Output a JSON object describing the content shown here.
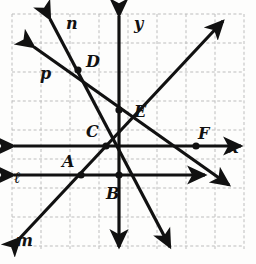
{
  "figure": {
    "background": "#fdfdfc",
    "grid": {
      "color": "#bdbdbd",
      "style": "dashed",
      "origin_px": [
        119,
        146
      ],
      "spacing_px": 29,
      "left_px": 12,
      "top_px": 14,
      "right_px": 244,
      "bottom_px": 249,
      "columns": 8,
      "rows": 8
    },
    "stroke_color": "#111111",
    "line_width_px": 3.2,
    "axes": [
      {
        "name": "x-axis",
        "label": "x",
        "label_px": [
          229,
          140
        ],
        "from_px": [
          14,
          146
        ],
        "to_px": [
          241,
          146
        ],
        "arrows": "both"
      },
      {
        "name": "y-axis",
        "label": "y",
        "label_px": [
          134,
          16
        ],
        "from_px": [
          119,
          16
        ],
        "to_px": [
          119,
          247
        ],
        "arrows": "both"
      }
    ],
    "lines": [
      {
        "name": "line-l",
        "label": "ℓ",
        "label_px": [
          14,
          170
        ],
        "from_px": [
          14,
          175
        ],
        "to_px": [
          205,
          175
        ],
        "arrows": "both",
        "description": "horizontal line below the x-axis"
      },
      {
        "name": "line-m",
        "label": "m",
        "label_px": [
          16,
          233
        ],
        "from_px": [
          20,
          238
        ],
        "to_px": [
          223,
          21
        ],
        "arrows": "both",
        "description": "diagonal rising to upper right through E"
      },
      {
        "name": "line-n",
        "label": "n",
        "label_px": [
          66,
          16
        ],
        "from_px": [
          50,
          19
        ],
        "to_px": [
          170,
          247
        ],
        "arrows": "both",
        "description": "steep line falling to lower right through D, C, B"
      },
      {
        "name": "line-p",
        "label": "p",
        "label_px": [
          40,
          66
        ],
        "from_px": [
          34,
          47
        ],
        "to_px": [
          229,
          185
        ],
        "arrows": "both",
        "description": "line falling to lower right through D, E, F"
      }
    ],
    "points": [
      {
        "name": "point-A",
        "label": "A",
        "at_px": [
          81,
          175
        ],
        "label_px": [
          62,
          154
        ],
        "lines": [
          "line-l",
          "line-m"
        ]
      },
      {
        "name": "point-B",
        "label": "B",
        "at_px": [
          119,
          175
        ],
        "label_px": [
          106,
          186
        ],
        "lines": [
          "line-l",
          "line-n",
          "y-axis"
        ]
      },
      {
        "name": "point-C",
        "label": "C",
        "at_px": [
          106,
          146
        ],
        "label_px": [
          86,
          124
        ],
        "lines": [
          "x-axis",
          "line-m",
          "line-n"
        ]
      },
      {
        "name": "point-D",
        "label": "D",
        "at_px": [
          78,
          70
        ],
        "label_px": [
          86,
          54
        ],
        "lines": [
          "line-n",
          "line-p"
        ]
      },
      {
        "name": "point-E",
        "label": "E",
        "at_px": [
          119,
          110
        ],
        "label_px": [
          134,
          104
        ],
        "lines": [
          "y-axis",
          "line-m",
          "line-p"
        ]
      },
      {
        "name": "point-F",
        "label": "F",
        "at_px": [
          196,
          146
        ],
        "label_px": [
          198,
          126
        ],
        "lines": [
          "x-axis",
          "line-p"
        ]
      }
    ],
    "point_radius_px": 3.6,
    "label_font_size_px": 16
  }
}
